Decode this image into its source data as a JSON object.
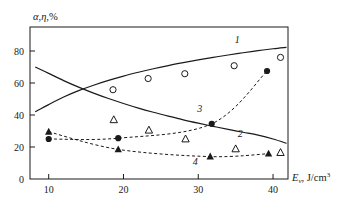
{
  "chart_data": {
    "type": "line",
    "title": "",
    "xlabel": "E_v, J/cm^3",
    "xlabel_parts": {
      "symbol": "E",
      "subscript": "v",
      "rest": ", J/cm",
      "superscript": "3"
    },
    "ylabel": "α, η, %",
    "xlim": [
      7.5,
      42
    ],
    "ylim": [
      0,
      95
    ],
    "xticks": [
      10,
      20,
      30,
      40
    ],
    "yticks": [
      0,
      20,
      40,
      60,
      80
    ],
    "grid": false,
    "legend": "inline-curve-numbers",
    "curve_labels": [
      {
        "id": "1",
        "x": 35.2,
        "y": 85.0
      },
      {
        "id": "2",
        "x": 35.6,
        "y": 26.5
      },
      {
        "id": "3",
        "x": 30.2,
        "y": 42.0
      },
      {
        "id": "4",
        "x": 29.6,
        "y": 8.5
      }
    ],
    "series": [
      {
        "name": "1",
        "style": "solid-line",
        "marker": "none",
        "color": "#1a1a1a",
        "x": [
          8.2,
          10,
          12,
          14,
          16,
          18,
          20,
          22,
          24,
          26,
          28,
          30,
          32,
          34,
          36,
          38,
          40,
          41.8
        ],
        "values": [
          42,
          46.5,
          51.2,
          55.2,
          58.6,
          61.6,
          64.3,
          66.7,
          68.9,
          70.9,
          72.7,
          74.4,
          76.0,
          77.5,
          78.9,
          80.2,
          81.4,
          82.3
        ]
      },
      {
        "name": "2",
        "style": "solid-line",
        "marker": "none",
        "color": "#1a1a1a",
        "x": [
          8.2,
          10,
          12,
          14,
          16,
          18,
          20,
          22,
          24,
          26,
          28,
          30,
          32,
          34,
          36,
          38,
          40,
          41.8
        ],
        "values": [
          70,
          66.0,
          61.5,
          57.4,
          53.7,
          50.3,
          47.2,
          44.3,
          41.7,
          39.3,
          37.0,
          34.9,
          32.9,
          31.0,
          29.2,
          27.4,
          25.0,
          22.3
        ]
      },
      {
        "name": "3",
        "style": "dashed-line",
        "marker": "filled-circle",
        "color": "#1a1a1a",
        "x": [
          10,
          19.3,
          31.8,
          39.2
        ],
        "values": [
          25,
          25.5,
          34.5,
          67.5
        ]
      },
      {
        "name": "4",
        "style": "dashed-line",
        "marker": "filled-triangle",
        "color": "#1a1a1a",
        "x": [
          10,
          19.3,
          31.6,
          39.4
        ],
        "values": [
          29.5,
          18.5,
          14.0,
          15.8
        ]
      },
      {
        "name": "open-circles",
        "style": "markers-only",
        "marker": "open-circle",
        "color": "#1a1a1a",
        "x": [
          18.6,
          23.3,
          28.2,
          34.8,
          41.0
        ],
        "values": [
          55.8,
          62.8,
          65.8,
          70.8,
          76.0
        ]
      },
      {
        "name": "open-triangles",
        "style": "markers-only",
        "marker": "open-triangle",
        "color": "#1a1a1a",
        "x": [
          18.7,
          23.4,
          28.3,
          35.0,
          41.0
        ],
        "values": [
          37.0,
          30.5,
          25.0,
          18.8,
          16.5
        ]
      }
    ]
  }
}
